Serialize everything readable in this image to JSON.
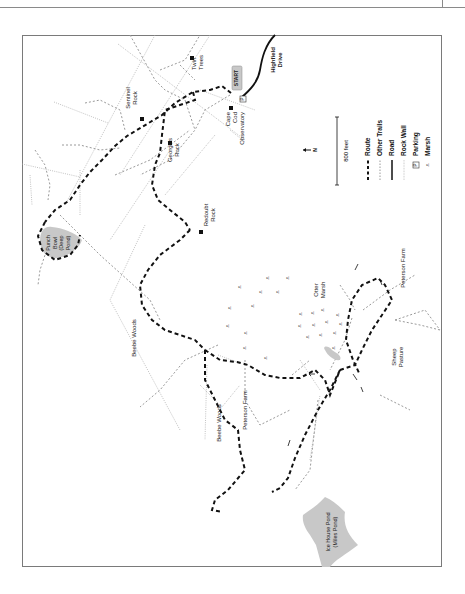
{
  "map": {
    "orientation": "rotated 90° counterclockwise",
    "labels": {
      "start": "START",
      "highfield_drive": [
        "Highfield",
        "Drive"
      ],
      "cape_cod_observatory": [
        "Cape",
        "Cod",
        "Observatory"
      ],
      "twin_trees": [
        "Twin",
        "Trees"
      ],
      "sentinel_rock": [
        "Sentinel",
        "Rock"
      ],
      "georges_rock": [
        "George's",
        "Rock"
      ],
      "redoubt_rock": [
        "Redoubt",
        "Rock"
      ],
      "punch_bowl": [
        "Punch",
        "Bowl",
        "(Deep",
        "Pond)"
      ],
      "beebe_woods_north": "Beebe Woods",
      "beebe_woods_south": "Beebe Woods",
      "otter_marsh": [
        "Otter",
        "Marsh"
      ],
      "peterson_farm_east": "Peterson Farm",
      "peterson_farm_south": "Peterson Farm",
      "sheep_pasture": [
        "Sheep",
        "Pasture"
      ],
      "ice_house_pond": [
        "Ice House Pond",
        "(Miles Pond)"
      ]
    },
    "north_arrow": "N",
    "scale_bar": "800 feet",
    "legend": [
      {
        "symbol": "route",
        "label": "Route"
      },
      {
        "symbol": "other-trails",
        "label": "Other Trails"
      },
      {
        "symbol": "road",
        "label": "Road"
      },
      {
        "symbol": "rock-wall",
        "label": "Rock Wall"
      },
      {
        "symbol": "parking",
        "label": "Parking",
        "glyph": "P"
      },
      {
        "symbol": "marsh",
        "label": "Marsh"
      }
    ],
    "parking_glyph": "P",
    "colors": {
      "route": "#111111",
      "other_trails": "#9a9a9a",
      "road": "#111111",
      "rock_wall": "#9a9a9a",
      "water": "#c8c8c8",
      "frame": "#7a7a7a"
    }
  }
}
